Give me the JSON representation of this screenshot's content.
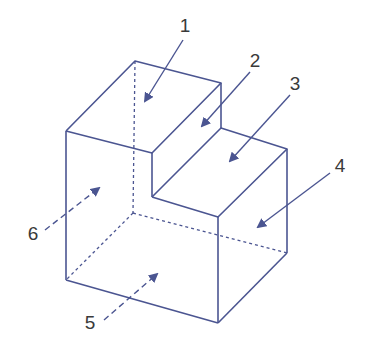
{
  "diagram": {
    "type": "isometric-stepped-block",
    "colors": {
      "edge": "#4b5591",
      "label": "#3a3a3a",
      "background": "#ffffff"
    },
    "labels": [
      {
        "id": "1",
        "text": "1",
        "face": "upper-step-top",
        "x": 185,
        "y": 25
      },
      {
        "id": "2",
        "text": "2",
        "face": "step-riser",
        "x": 255,
        "y": 60
      },
      {
        "id": "3",
        "text": "3",
        "face": "lower-step-top",
        "x": 295,
        "y": 83
      },
      {
        "id": "4",
        "text": "4",
        "face": "right-side",
        "x": 340,
        "y": 165
      },
      {
        "id": "5",
        "text": "5",
        "face": "bottom (hidden)",
        "x": 90,
        "y": 322
      },
      {
        "id": "6",
        "text": "6",
        "face": "back-left (hidden)",
        "x": 33,
        "y": 233
      }
    ]
  }
}
